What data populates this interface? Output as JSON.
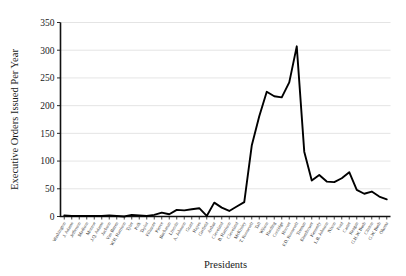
{
  "chart_data": {
    "type": "line",
    "title": "",
    "xlabel": "Presidents",
    "ylabel": "Executive Orders Issued Per Year",
    "ylim": [
      0,
      350
    ],
    "yticks": [
      0,
      50,
      100,
      150,
      200,
      250,
      300,
      350
    ],
    "grid": true,
    "legend": "none",
    "line_color": "#000000",
    "categories": [
      "Washington",
      "J. Adams",
      "Jefferson",
      "Madison",
      "Monroe",
      "J.Q. Adams",
      "Jackson",
      "Van Buren",
      "W.H. Harrison",
      "Tyler",
      "Polk",
      "Taylor",
      "Fillmore",
      "Pierce",
      "Buchanan",
      "Lincoln",
      "A. Johnson",
      "Grant",
      "Hayes",
      "Garfield",
      "Arthur",
      "Cleveland",
      "B. Harrison",
      "Cleveland",
      "McKinley",
      "T. Roosevelt",
      "Taft",
      "Wilson",
      "Harding",
      "Coolidge",
      "Hoover",
      "F.D. Roosevelt",
      "Truman",
      "Eisenhower",
      "Kennedy",
      "L.B. Johnson",
      "Nixon",
      "Ford",
      "Carter",
      "Reagan",
      "G.H.W. Bush",
      "Clinton",
      "G.W. Bush",
      "Obama"
    ],
    "values": [
      2,
      1,
      1,
      1,
      1,
      1,
      2,
      1,
      0,
      3,
      2,
      1,
      3,
      7,
      4,
      12,
      11,
      13,
      15,
      1,
      25,
      16,
      10,
      18,
      26,
      128,
      181,
      225,
      217,
      215,
      242,
      307,
      117,
      65,
      75,
      63,
      62,
      69,
      80,
      48,
      41,
      45,
      36,
      31
    ]
  },
  "axes": {
    "y_axis_title": "Executive Orders Issued Per Year",
    "x_axis_title": "Presidents"
  }
}
